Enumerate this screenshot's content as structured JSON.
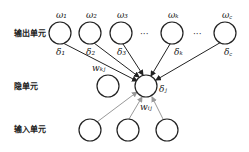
{
  "diagram": {
    "rows": {
      "output_label": "输出单元",
      "hidden_label": "隐单元",
      "input_label": "输入单元"
    },
    "output_units": [
      {
        "id": "o1",
        "top": "ω₁",
        "bottom": "δ₁"
      },
      {
        "id": "o2",
        "top": "ω₂",
        "bottom": "δ₂"
      },
      {
        "id": "o3",
        "top": "ω₃",
        "bottom": "δ₃"
      },
      {
        "id": "ok",
        "top": "ωₖ",
        "bottom": "δₖ"
      },
      {
        "id": "oc",
        "top": "ω꜀",
        "bottom": "δ꜀"
      }
    ],
    "ellipsis": "···",
    "hidden_units": [
      {
        "id": "h0",
        "label": ""
      },
      {
        "id": "hj",
        "label": "δⱼ"
      }
    ],
    "input_units": [
      {
        "id": "i1"
      },
      {
        "id": "i2"
      },
      {
        "id": "i3"
      }
    ],
    "weights": {
      "output_weight": "wₖⱼ",
      "input_weight": "wᵢⱼ"
    },
    "colors": {
      "stroke": "#222222",
      "light_edge": "#999999"
    }
  }
}
